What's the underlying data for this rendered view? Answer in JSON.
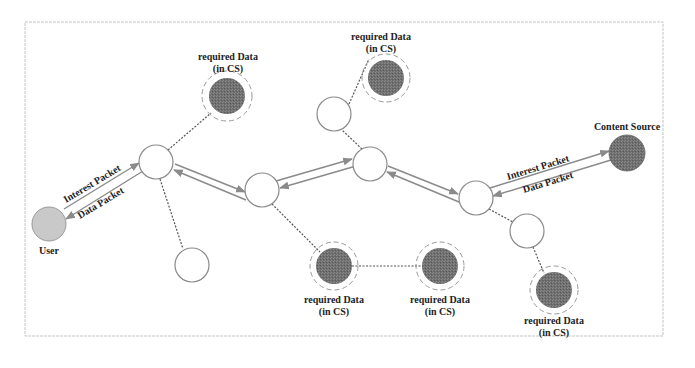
{
  "diagram": {
    "type": "network-topology",
    "colors": {
      "frame": "#b8b8b8",
      "router_stroke": "#8a8a8a",
      "router_fill": "#ffffff",
      "user_fill": "#c9c9c9",
      "cache_fill": "#6f6f6f",
      "source_fill": "#777777",
      "link": "#8a8a8a",
      "dotted": "#555555"
    },
    "labels": {
      "user": "User",
      "content_source": "Content Source",
      "cache_line1": "required Data",
      "cache_line2": "(in CS)",
      "interest_packet": "Interest Packet",
      "data_packet": "Data Packet"
    },
    "nodes": [
      {
        "id": "user",
        "kind": "user",
        "x": 49,
        "y": 224,
        "label": "User"
      },
      {
        "id": "router-a",
        "kind": "router",
        "x": 156,
        "y": 162
      },
      {
        "id": "leaf-a",
        "kind": "router",
        "x": 192,
        "y": 265
      },
      {
        "id": "cache-1",
        "kind": "cache",
        "x": 227,
        "y": 96,
        "label": "required Data (in CS)"
      },
      {
        "id": "router-b",
        "kind": "router",
        "x": 262,
        "y": 190
      },
      {
        "id": "router-c",
        "kind": "router",
        "x": 370,
        "y": 164
      },
      {
        "id": "router-c-up",
        "kind": "router",
        "x": 334,
        "y": 114
      },
      {
        "id": "cache-2",
        "kind": "cache",
        "x": 386,
        "y": 49,
        "label": "required Data (in CS)"
      },
      {
        "id": "router-d",
        "kind": "router",
        "x": 476,
        "y": 198
      },
      {
        "id": "router-d-down",
        "kind": "router",
        "x": 527,
        "y": 231
      },
      {
        "id": "source",
        "kind": "source",
        "x": 627,
        "y": 153,
        "label": "Content Source"
      },
      {
        "id": "cache-3",
        "kind": "cache",
        "x": 334,
        "y": 266,
        "label": "required Data (in CS)"
      },
      {
        "id": "cache-4",
        "kind": "cache",
        "x": 440,
        "y": 266,
        "label": "required Data (in CS)"
      },
      {
        "id": "cache-5",
        "kind": "cache",
        "x": 554,
        "y": 290,
        "label": "required Data (in CS)"
      }
    ],
    "edges": [
      {
        "from": "user",
        "to": "router-a",
        "style": "double-arrow",
        "labels": [
          "Interest Packet",
          "Data Packet"
        ]
      },
      {
        "from": "router-a",
        "to": "router-b",
        "style": "double-arrow"
      },
      {
        "from": "router-b",
        "to": "router-c",
        "style": "double-arrow"
      },
      {
        "from": "router-c",
        "to": "router-d",
        "style": "double-arrow"
      },
      {
        "from": "router-d",
        "to": "source",
        "style": "double-arrow",
        "labels": [
          "Interest Packet",
          "Data Packet"
        ]
      },
      {
        "from": "router-a",
        "to": "cache-1",
        "style": "dotted"
      },
      {
        "from": "router-a",
        "to": "leaf-a",
        "style": "dotted"
      },
      {
        "from": "router-c",
        "to": "router-c-up",
        "style": "dotted"
      },
      {
        "from": "router-c-up",
        "to": "cache-2",
        "style": "dotted"
      },
      {
        "from": "router-b",
        "to": "cache-3",
        "style": "dotted"
      },
      {
        "from": "cache-3",
        "to": "cache-4",
        "style": "dotted"
      },
      {
        "from": "router-d",
        "to": "router-d-down",
        "style": "dotted"
      },
      {
        "from": "router-d-down",
        "to": "cache-5",
        "style": "dotted"
      }
    ]
  }
}
